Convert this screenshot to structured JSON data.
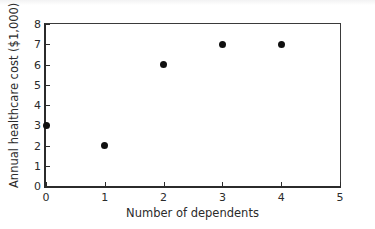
{
  "chart_data": {
    "type": "scatter",
    "title": "",
    "xlabel": "Number of dependents",
    "ylabel": "Annual healthcare cost ($1,000)",
    "x": [
      0,
      1,
      2,
      3,
      4
    ],
    "values": [
      3,
      2,
      6,
      7,
      7
    ],
    "points": [
      {
        "x": 0,
        "y": 3
      },
      {
        "x": 1,
        "y": 2
      },
      {
        "x": 2,
        "y": 6
      },
      {
        "x": 3,
        "y": 7
      },
      {
        "x": 4,
        "y": 7
      }
    ],
    "xlim": [
      0,
      5
    ],
    "ylim": [
      0,
      8
    ],
    "xticks": [
      0,
      1,
      2,
      3,
      4,
      5
    ],
    "yticks": [
      0,
      1,
      2,
      3,
      4,
      5,
      6,
      7,
      8
    ],
    "xtick_labels": [
      "0",
      "1",
      "2",
      "3",
      "4",
      "5"
    ],
    "ytick_labels": [
      "0",
      "1",
      "2",
      "3",
      "4",
      "5",
      "6",
      "7",
      "8"
    ],
    "grid": false,
    "legend": null,
    "marker_color": "#101010",
    "axis_color": "#2b2b2b"
  }
}
